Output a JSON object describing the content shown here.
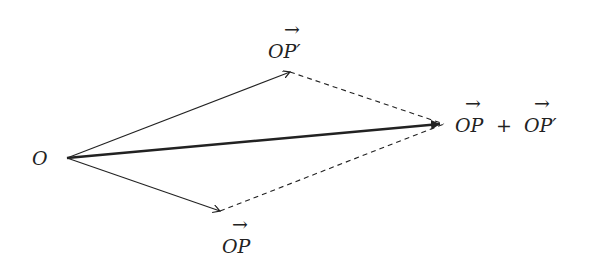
{
  "diagram": {
    "type": "vector-parallelogram-addition",
    "colors": {
      "stroke": "#222222",
      "background": "#ffffff"
    },
    "points": {
      "O": {
        "x": 67,
        "y": 158
      },
      "P": {
        "x": 220,
        "y": 211
      },
      "P_prime": {
        "x": 290,
        "y": 72
      },
      "sum": {
        "x": 444,
        "y": 124
      }
    },
    "labels": {
      "origin": "O",
      "op": "OP",
      "op_prime": "OP′",
      "sum_left": "OP",
      "plus": "+",
      "sum_right": "OP′"
    },
    "edges": [
      {
        "from": "O",
        "to": "P",
        "style": "solid-arrow"
      },
      {
        "from": "O",
        "to": "P_prime",
        "style": "solid-arrow"
      },
      {
        "from": "O",
        "to": "sum",
        "style": "thick-arrow"
      },
      {
        "from": "P",
        "to": "sum",
        "style": "dashed"
      },
      {
        "from": "P_prime",
        "to": "sum",
        "style": "dashed"
      }
    ]
  }
}
